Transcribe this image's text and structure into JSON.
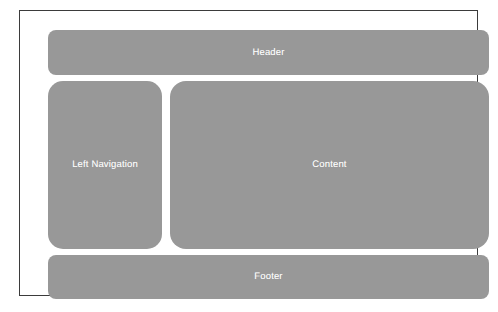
{
  "diagram": {
    "background_color": "#ffffff",
    "frame": {
      "border_color": "#3b3b3b",
      "fill_color": "#ffffff"
    },
    "block_fill_color": "#989898",
    "block_text_color": "#ffffff",
    "regions": [
      {
        "id": "header",
        "label": "Header",
        "position": "top",
        "span": "full-width"
      },
      {
        "id": "left-navigation",
        "label": "Left Navigation",
        "position": "middle-left",
        "span": "column"
      },
      {
        "id": "content",
        "label": "Content",
        "position": "middle-right",
        "span": "main"
      },
      {
        "id": "footer",
        "label": "Footer",
        "position": "bottom",
        "span": "full-width"
      }
    ]
  }
}
